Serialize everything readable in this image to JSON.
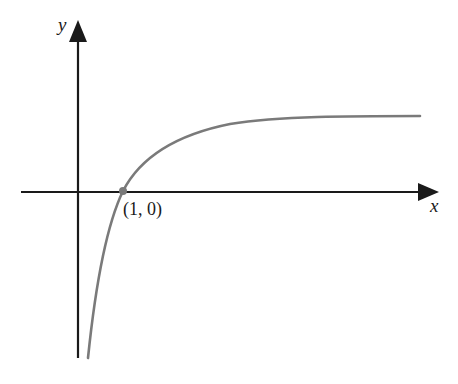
{
  "figure": {
    "type": "function-graph",
    "axes": {
      "x_label": "x",
      "y_label": "y"
    },
    "point": {
      "label": "(1, 0)",
      "x": 1,
      "y": 0
    },
    "colors": {
      "axes": "#1a1a1a",
      "curve": "#7a7a7a",
      "point": "#7a7a7a",
      "background": "#ffffff"
    }
  }
}
